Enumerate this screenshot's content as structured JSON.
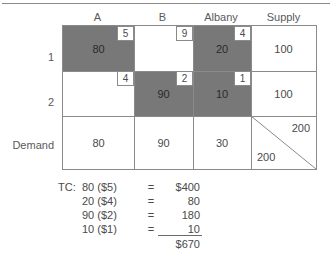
{
  "table": {
    "column_headers": [
      "A",
      "B",
      "Albany",
      "Supply"
    ],
    "row_labels": [
      "1",
      "2",
      "Demand"
    ],
    "rows": [
      {
        "label": "1",
        "cells": [
          {
            "cost": "5",
            "amount": "80",
            "shaded": true
          },
          {
            "cost": "9",
            "amount": "",
            "shaded": false
          },
          {
            "cost": "4",
            "amount": "20",
            "shaded": true
          }
        ],
        "supply": "100"
      },
      {
        "label": "2",
        "cells": [
          {
            "cost": "4",
            "amount": "",
            "shaded": false
          },
          {
            "cost": "2",
            "amount": "90",
            "shaded": true
          },
          {
            "cost": "1",
            "amount": "10",
            "shaded": true
          }
        ],
        "supply": "100"
      }
    ],
    "demand": {
      "label": "Demand",
      "values": [
        "80",
        "90",
        "30"
      ],
      "total_supply": "200",
      "total_demand": "200"
    }
  },
  "calculation": {
    "label": "TC:",
    "lines": [
      {
        "expr": "80 ($5)",
        "eq": "=",
        "value": "$400"
      },
      {
        "expr": "20 ($4)",
        "eq": "=",
        "value": "80"
      },
      {
        "expr": "90 ($2)",
        "eq": "=",
        "value": "180"
      },
      {
        "expr": "10 ($1)",
        "eq": "=",
        "value": "10"
      }
    ],
    "total": "$670"
  },
  "colors": {
    "shade": "#787878",
    "border": "#8a8a8a",
    "text": "#4a4a4a"
  }
}
